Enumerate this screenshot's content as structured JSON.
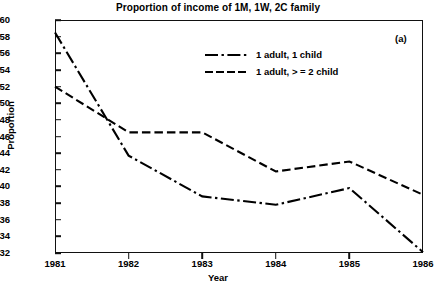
{
  "chart_data": {
    "type": "line",
    "title": "Proportion of income of 1M, 1W, 2C family",
    "xlabel": "Year",
    "ylabel": "Proportion",
    "annotation": "(a)",
    "x": [
      1981,
      1982,
      1983,
      1984,
      1985,
      1986
    ],
    "xticklabels": [
      "1981",
      "1982",
      "1983",
      "1984",
      "1985",
      "1986"
    ],
    "xlim": [
      1981,
      1986
    ],
    "ylim": [
      0.32,
      0.6
    ],
    "yticks": [
      0.32,
      0.34,
      0.36,
      0.38,
      0.4,
      0.42,
      0.44,
      0.46,
      0.48,
      0.5,
      0.52,
      0.54,
      0.56,
      0.58,
      0.6
    ],
    "yticklabels": [
      "0.32",
      "0.34",
      "0.36",
      "0.38",
      "0.40",
      "0.42",
      "0.44",
      "0.46",
      "0.48",
      "0.50",
      "0.52",
      "0.54",
      "0.56",
      "0.58",
      "0.60"
    ],
    "grid": false,
    "legend_position": "upper center",
    "series": [
      {
        "name": "1 adult, 1 child",
        "linestyle": "dashdot",
        "color": "#000000",
        "values": [
          0.585,
          0.437,
          0.388,
          0.378,
          0.398,
          0.321
        ]
      },
      {
        "name": "1 adult, > = 2 child",
        "linestyle": "dashed",
        "color": "#000000",
        "values": [
          0.52,
          0.465,
          0.465,
          0.418,
          0.43,
          0.39
        ]
      }
    ]
  },
  "legend": {
    "entries": [
      {
        "label": "1 adult, 1 child"
      },
      {
        "label": "1 adult, > = 2 child"
      }
    ]
  }
}
